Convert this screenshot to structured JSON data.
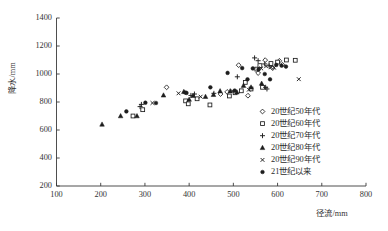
{
  "chart_data": {
    "type": "scatter",
    "title": "",
    "xlabel": "径流/mm",
    "ylabel": "降水/mm",
    "xlim": [
      100,
      800
    ],
    "ylim": [
      200,
      1400
    ],
    "xticks": [
      100,
      200,
      300,
      400,
      500,
      600,
      700,
      800
    ],
    "yticks": [
      200,
      400,
      600,
      800,
      1000,
      1200,
      1400
    ],
    "grid": false,
    "legend_position": "right-inside",
    "series": [
      {
        "name": "20世纪50年代",
        "marker": "diamond-open",
        "points": [
          [
            349,
            905
          ],
          [
            471,
            857
          ],
          [
            512,
            1063
          ],
          [
            533,
            845
          ],
          [
            556,
            1007
          ],
          [
            572,
            1099
          ],
          [
            589,
            1042
          ],
          [
            604,
            1094
          ],
          [
            611,
            1066
          ],
          [
            486,
            872
          ]
        ]
      },
      {
        "name": "20世纪60年代",
        "marker": "square-open",
        "points": [
          [
            273,
            700
          ],
          [
            295,
            745
          ],
          [
            392,
            808
          ],
          [
            398,
            787
          ],
          [
            447,
            779
          ],
          [
            491,
            843
          ],
          [
            518,
            880
          ],
          [
            527,
            940
          ],
          [
            540,
            893
          ],
          [
            553,
            1035
          ],
          [
            560,
            1060
          ],
          [
            585,
            1075
          ],
          [
            600,
            1085
          ],
          [
            620,
            1100
          ],
          [
            640,
            1098
          ],
          [
            418,
            823
          ],
          [
            504,
            866
          ],
          [
            566,
            905
          ]
        ]
      },
      {
        "name": "20世纪70年代",
        "marker": "plus",
        "points": [
          [
            289,
            767
          ],
          [
            292,
            783
          ],
          [
            404,
            847
          ],
          [
            412,
            857
          ],
          [
            456,
            862
          ],
          [
            509,
            980
          ],
          [
            548,
            1115
          ],
          [
            556,
            1095
          ],
          [
            571,
            1072
          ],
          [
            581,
            1058
          ],
          [
            573,
            905
          ],
          [
            576,
            893
          ]
        ]
      },
      {
        "name": "20世纪80年代",
        "marker": "triangle-filled",
        "points": [
          [
            203,
            640
          ],
          [
            245,
            700
          ],
          [
            282,
            700
          ],
          [
            342,
            848
          ],
          [
            388,
            873
          ],
          [
            409,
            845
          ],
          [
            437,
            838
          ],
          [
            455,
            852
          ],
          [
            470,
            878
          ],
          [
            493,
            878
          ],
          [
            508,
            870
          ],
          [
            523,
            917
          ],
          [
            540,
            905
          ],
          [
            564,
            932
          ],
          [
            400,
            818
          ]
        ]
      },
      {
        "name": "20世纪90年代",
        "marker": "x-small",
        "points": [
          [
            376,
            862
          ],
          [
            426,
            838
          ],
          [
            498,
            878
          ],
          [
            535,
            888
          ],
          [
            563,
            1040
          ],
          [
            574,
            1055
          ],
          [
            592,
            1045
          ],
          [
            648,
            963
          ],
          [
            317,
            793
          ],
          [
            585,
            1048
          ]
        ]
      },
      {
        "name": "21世纪以来",
        "marker": "circle-filled",
        "points": [
          [
            258,
            733
          ],
          [
            301,
            795
          ],
          [
            325,
            793
          ],
          [
            391,
            868
          ],
          [
            448,
            905
          ],
          [
            487,
            1008
          ],
          [
            520,
            1042
          ],
          [
            532,
            962
          ],
          [
            544,
            1040
          ],
          [
            557,
            1033
          ],
          [
            571,
            1000
          ],
          [
            583,
            962
          ],
          [
            597,
            1065
          ],
          [
            609,
            1060
          ],
          [
            619,
            1053
          ],
          [
            394,
            865
          ],
          [
            503,
            882
          ]
        ]
      }
    ]
  },
  "legend": {
    "entries": [
      {
        "label": "20世纪50年代",
        "marker": "diamond-open"
      },
      {
        "label": "20世纪60年代",
        "marker": "square-open"
      },
      {
        "label": "20世纪70年代",
        "marker": "plus"
      },
      {
        "label": "20世纪80年代",
        "marker": "triangle-filled"
      },
      {
        "label": "20世纪90年代",
        "marker": "x-small"
      },
      {
        "label": "21世纪以来",
        "marker": "circle-filled"
      }
    ]
  },
  "axes": {
    "x_tick_labels": [
      "100",
      "200",
      "300",
      "400",
      "500",
      "600",
      "700",
      "800"
    ],
    "y_tick_labels": [
      "200",
      "400",
      "600",
      "800",
      "1000",
      "1200",
      "1400"
    ],
    "x_axis_title": "径流/mm",
    "y_axis_title": "降水/mm"
  },
  "style": {
    "marker_color": "#1d1d1d",
    "axis_color": "#3a3a3a",
    "background": "#ffffff"
  }
}
